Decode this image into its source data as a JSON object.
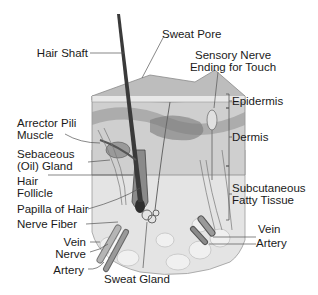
{
  "diagram": {
    "type": "anatomical cross-section",
    "labels_left": [
      {
        "id": "hair-shaft",
        "text": "Hair Shaft"
      },
      {
        "id": "arrector-pili",
        "line1": "Arrector Pili",
        "line2": "Muscle"
      },
      {
        "id": "sebaceous-gland",
        "line1": "Sebaceous",
        "line2": "(Oil) Gland"
      },
      {
        "id": "hair-follicle",
        "line1": "Hair",
        "line2": "Follicle"
      },
      {
        "id": "papilla",
        "text": "Papilla of Hair"
      },
      {
        "id": "nerve-fiber",
        "text": "Nerve Fiber"
      },
      {
        "id": "vein-left",
        "text": "Vein"
      },
      {
        "id": "nerve",
        "text": "Nerve"
      },
      {
        "id": "artery-left",
        "text": "Artery"
      }
    ],
    "labels_top": [
      {
        "id": "sweat-pore",
        "text": "Sweat Pore"
      },
      {
        "id": "sensory-nerve",
        "line1": "Sensory Nerve",
        "line2": "Ending for Touch"
      }
    ],
    "labels_right": [
      {
        "id": "epidermis",
        "text": "Epidermis"
      },
      {
        "id": "dermis",
        "text": "Dermis"
      },
      {
        "id": "subcutaneous",
        "line1": "Subcutaneous",
        "line2": "Fatty Tissue"
      },
      {
        "id": "vein-right",
        "text": "Vein"
      },
      {
        "id": "artery-right",
        "text": "Artery"
      }
    ],
    "labels_bottom": [
      {
        "id": "sweat-gland",
        "text": "Sweat Gland"
      }
    ],
    "layers": [
      "Epidermis",
      "Dermis",
      "Subcutaneous Fatty Tissue"
    ],
    "colors": {
      "skin_light": "#d9d9d9",
      "skin_mid": "#a8a8a8",
      "skin_dark": "#6e6e6e",
      "hair": "#3a3a3a",
      "fat": "#e6e6e6",
      "line": "#444444"
    }
  }
}
